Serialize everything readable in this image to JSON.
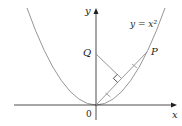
{
  "diagram": {
    "axes": {
      "x_label": "x",
      "y_label": "y",
      "origin_label": "0"
    },
    "curve_label": "y = x²",
    "points": {
      "P": "P",
      "Q": "Q"
    },
    "colors": {
      "axis": "#231f20",
      "curve": "#8a8a8a",
      "segment": "#8a8a8a",
      "text": "#231f20"
    }
  }
}
